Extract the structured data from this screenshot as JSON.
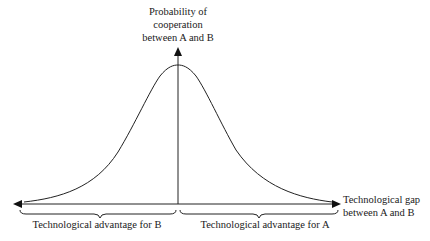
{
  "diagram": {
    "y_axis_label": [
      "Probability of",
      "cooperation",
      "between A and B"
    ],
    "x_axis_label": [
      "Technological gap",
      "between A and B"
    ],
    "left_region_label": "Technological advantage for B",
    "right_region_label": "Technological advantage for A",
    "curve": "bell-shaped, peak at zero gap, symmetric decline toward both extremes",
    "stroke_color": "#222222",
    "background": "#ffffff"
  }
}
